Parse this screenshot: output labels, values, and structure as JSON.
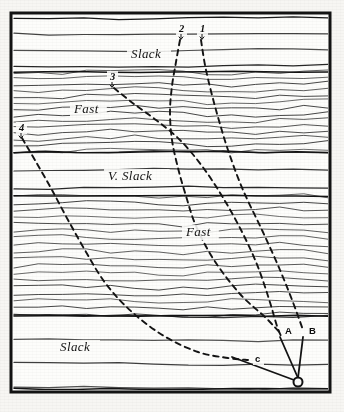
{
  "figure": {
    "background_color": "#f7f6f3",
    "ink_color": "#131313",
    "frame": {
      "x": 11,
      "y": 13,
      "width": 319,
      "height": 379,
      "border_width": 3
    }
  },
  "band_labels": [
    {
      "id": "slack-top",
      "text": "Slack",
      "x": 131,
      "y": 58,
      "style": "italic"
    },
    {
      "id": "fast-upper",
      "text": "Fast",
      "x": 74,
      "y": 113,
      "style": "italic"
    },
    {
      "id": "v-slack",
      "text": "V. Slack",
      "x": 108,
      "y": 180,
      "style": "italic"
    },
    {
      "id": "fast-lower",
      "text": "Fast",
      "x": 186,
      "y": 236,
      "style": "italic"
    },
    {
      "id": "slack-bottom",
      "text": "Slack",
      "x": 60,
      "y": 351,
      "style": "italic"
    }
  ],
  "curve_markers": [
    {
      "id": "marker-1",
      "text": "1",
      "x": 200,
      "y": 32
    },
    {
      "id": "marker-2",
      "text": "2",
      "x": 179,
      "y": 32
    },
    {
      "id": "marker-3",
      "text": "3",
      "x": 110,
      "y": 80
    },
    {
      "id": "marker-4",
      "text": "4",
      "x": 19,
      "y": 131
    }
  ],
  "point_labels": [
    {
      "id": "point-a",
      "text": "A",
      "x": 285,
      "y": 334
    },
    {
      "id": "point-b",
      "text": "B",
      "x": 309,
      "y": 334
    },
    {
      "id": "point-c",
      "text": "c",
      "x": 255,
      "y": 362
    }
  ],
  "origin_marker": {
    "id": "origin-circle",
    "cx": 298,
    "cy": 382,
    "r": 4.5
  },
  "convergence_lines": [
    {
      "id": "line-a-origin",
      "x1": 280,
      "y1": 337,
      "x2": 298,
      "y2": 378
    },
    {
      "id": "line-b-origin",
      "x1": 303,
      "y1": 337,
      "x2": 298,
      "y2": 378
    },
    {
      "id": "line-c-origin",
      "x1": 232,
      "y1": 357,
      "x2": 294,
      "y2": 380
    }
  ],
  "chart_data": {
    "type": "line",
    "xlabel": "",
    "ylabel": "",
    "grid": false,
    "legend_position": "inline-annotations",
    "bands": [
      {
        "name": "Slack",
        "top": 18,
        "bottom": 72,
        "line_spacing": 16,
        "texture": "sparse"
      },
      {
        "name": "Fast",
        "top": 72,
        "bottom": 152,
        "line_spacing": 6,
        "texture": "dense-wavy"
      },
      {
        "name": "V. Slack",
        "top": 152,
        "bottom": 196,
        "line_spacing": 18,
        "texture": "sparse"
      },
      {
        "name": "Fast",
        "top": 196,
        "bottom": 316,
        "line_spacing": 7,
        "texture": "dense-wavy"
      },
      {
        "name": "Slack",
        "top": 316,
        "bottom": 389,
        "line_spacing": 24,
        "texture": "sparse"
      }
    ],
    "series": [
      {
        "name": "1",
        "style": "dashed",
        "points": [
          [
            201,
            40
          ],
          [
            206,
            70
          ],
          [
            216,
            110
          ],
          [
            228,
            150
          ],
          [
            243,
            190
          ],
          [
            262,
            230
          ],
          [
            280,
            270
          ],
          [
            294,
            305
          ],
          [
            303,
            330
          ]
        ]
      },
      {
        "name": "2",
        "style": "dashed",
        "points": [
          [
            180,
            40
          ],
          [
            176,
            62
          ],
          [
            172,
            86
          ],
          [
            170,
            112
          ],
          [
            172,
            140
          ],
          [
            178,
            168
          ],
          [
            186,
            196
          ],
          [
            196,
            226
          ],
          [
            214,
            260
          ],
          [
            240,
            294
          ],
          [
            266,
            318
          ],
          [
            281,
            334
          ]
        ]
      },
      {
        "name": "3",
        "style": "dashed",
        "points": [
          [
            114,
            88
          ],
          [
            134,
            104
          ],
          [
            156,
            120
          ],
          [
            180,
            140
          ],
          [
            202,
            166
          ],
          [
            222,
            196
          ],
          [
            240,
            228
          ],
          [
            256,
            262
          ],
          [
            268,
            296
          ],
          [
            277,
            326
          ],
          [
            281,
            336
          ]
        ]
      },
      {
        "name": "4",
        "style": "dashed",
        "points": [
          [
            22,
            138
          ],
          [
            36,
            162
          ],
          [
            52,
            190
          ],
          [
            68,
            220
          ],
          [
            86,
            252
          ],
          [
            106,
            284
          ],
          [
            132,
            312
          ],
          [
            164,
            336
          ],
          [
            198,
            352
          ],
          [
            228,
            358
          ],
          [
            248,
            360
          ]
        ]
      }
    ]
  }
}
